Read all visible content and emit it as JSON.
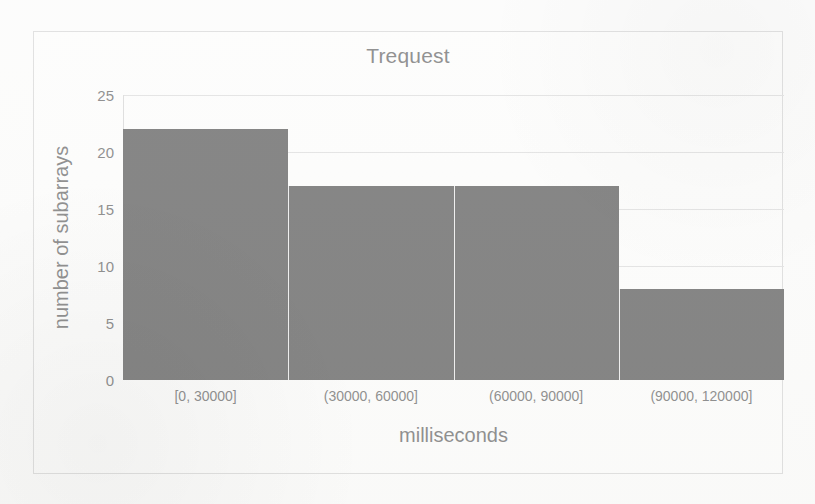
{
  "chart_data": {
    "type": "bar",
    "title": "Trequest",
    "xlabel": "milliseconds",
    "ylabel": "number of subarrays",
    "categories": [
      "[0, 30000]",
      "(30000, 60000]",
      "(60000, 90000]",
      "(90000, 120000]"
    ],
    "values": [
      22,
      17,
      17,
      8
    ],
    "ylim": [
      0,
      25
    ],
    "yticks": [
      0,
      5,
      10,
      15,
      20,
      25
    ],
    "ytick_labels": [
      "0",
      "5",
      "10",
      "15",
      "20",
      "25"
    ],
    "grid": true,
    "legend": false,
    "bar_color": "#474747",
    "gridline_color": "#d8d8d8",
    "text_color": "#585858",
    "background_color": "#fcfcfb",
    "border_color": "#d2d2d2"
  }
}
